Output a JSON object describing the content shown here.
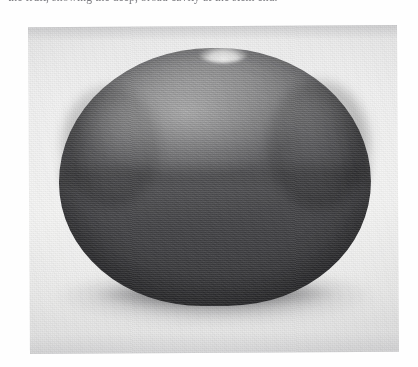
{
  "page": {
    "kind": "scanned-book-page",
    "background_color": "#fefefe"
  },
  "caption": {
    "text": "the fruit, showing the deep, broad cavity at the stem end.",
    "note": "Line is clipped by the top edge of the screenshot; only the lower halves of the letters are visible.",
    "color": "#5d5d63"
  },
  "photo": {
    "name": "black-and-white photograph of a round fruit",
    "subject": "round dark fruit (tomato / persimmon type) resting on a light surface",
    "orientation": "landscape",
    "frame": {
      "x": 29,
      "y": 26,
      "width": 369,
      "height": 327
    },
    "paper_color": "#eeeeee",
    "tilt_degrees": -0.35
  },
  "fruit": {
    "name": "round fruit",
    "shape": "broad oblate sphere, slightly wider than tall",
    "top_feature": "shallow dip / calyx notch at the crown",
    "highlight": "diffuse highlight on the upper-left shoulder",
    "tones": {
      "highlight": "#cdcdcd",
      "upper_body": "#7e7e80",
      "mid_body": "#5c5c5f",
      "lower_body": "#3a3a3d"
    },
    "bounds": {
      "x": 59,
      "y": 48,
      "width": 312,
      "height": 258
    }
  },
  "shadow": {
    "name": "cast shadow beneath fruit",
    "color": "#6a6a6e",
    "bounds": {
      "x": 51,
      "y": 269,
      "width": 326,
      "height": 62
    }
  }
}
